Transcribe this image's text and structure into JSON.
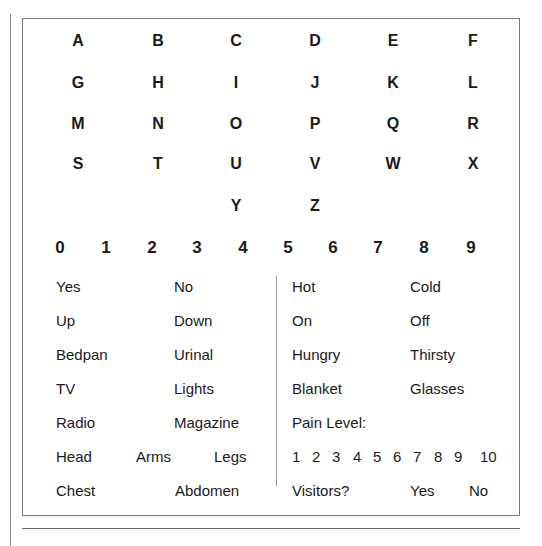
{
  "letters": [
    {
      "t": "A",
      "x": 78,
      "y": 41
    },
    {
      "t": "B",
      "x": 158,
      "y": 41
    },
    {
      "t": "C",
      "x": 236,
      "y": 41
    },
    {
      "t": "D",
      "x": 315,
      "y": 41
    },
    {
      "t": "E",
      "x": 393,
      "y": 41
    },
    {
      "t": "F",
      "x": 473,
      "y": 41
    },
    {
      "t": "G",
      "x": 78,
      "y": 83
    },
    {
      "t": "H",
      "x": 158,
      "y": 83
    },
    {
      "t": "I",
      "x": 236,
      "y": 83
    },
    {
      "t": "J",
      "x": 315,
      "y": 83
    },
    {
      "t": "K",
      "x": 393,
      "y": 83
    },
    {
      "t": "L",
      "x": 473,
      "y": 83
    },
    {
      "t": "M",
      "x": 78,
      "y": 124
    },
    {
      "t": "N",
      "x": 158,
      "y": 124
    },
    {
      "t": "O",
      "x": 236,
      "y": 124
    },
    {
      "t": "P",
      "x": 315,
      "y": 124
    },
    {
      "t": "Q",
      "x": 393,
      "y": 124
    },
    {
      "t": "R",
      "x": 473,
      "y": 124
    },
    {
      "t": "S",
      "x": 78,
      "y": 164
    },
    {
      "t": "T",
      "x": 158,
      "y": 164
    },
    {
      "t": "U",
      "x": 236,
      "y": 164
    },
    {
      "t": "V",
      "x": 315,
      "y": 164
    },
    {
      "t": "W",
      "x": 393,
      "y": 164
    },
    {
      "t": "X",
      "x": 473,
      "y": 164
    },
    {
      "t": "Y",
      "x": 236,
      "y": 206
    },
    {
      "t": "Z",
      "x": 315,
      "y": 206
    }
  ],
  "digits": [
    {
      "t": "0",
      "x": 60
    },
    {
      "t": "1",
      "x": 106
    },
    {
      "t": "2",
      "x": 152
    },
    {
      "t": "3",
      "x": 197
    },
    {
      "t": "4",
      "x": 243
    },
    {
      "t": "5",
      "x": 288
    },
    {
      "t": "6",
      "x": 333
    },
    {
      "t": "7",
      "x": 378
    },
    {
      "t": "8",
      "x": 424
    },
    {
      "t": "9",
      "x": 471
    }
  ],
  "digits_y": 247,
  "words_left": [
    {
      "t": "Yes",
      "x": 56,
      "y": 287
    },
    {
      "t": "No",
      "x": 174,
      "y": 287
    },
    {
      "t": "Up",
      "x": 56,
      "y": 321
    },
    {
      "t": "Down",
      "x": 174,
      "y": 321
    },
    {
      "t": "Bedpan",
      "x": 56,
      "y": 355
    },
    {
      "t": "Urinal",
      "x": 174,
      "y": 355
    },
    {
      "t": "TV",
      "x": 56,
      "y": 389
    },
    {
      "t": "Lights",
      "x": 174,
      "y": 389
    },
    {
      "t": "Radio",
      "x": 56,
      "y": 423
    },
    {
      "t": "Magazine",
      "x": 174,
      "y": 423
    },
    {
      "t": "Head",
      "x": 56,
      "y": 457
    },
    {
      "t": "Arms",
      "x": 136,
      "y": 457
    },
    {
      "t": "Legs",
      "x": 214,
      "y": 457
    },
    {
      "t": "Chest",
      "x": 56,
      "y": 491
    },
    {
      "t": "Abdomen",
      "x": 175,
      "y": 491
    }
  ],
  "words_right": [
    {
      "t": "Hot",
      "x": 292,
      "y": 287
    },
    {
      "t": "Cold",
      "x": 410,
      "y": 287
    },
    {
      "t": "On",
      "x": 292,
      "y": 321
    },
    {
      "t": "Off",
      "x": 410,
      "y": 321
    },
    {
      "t": "Hungry",
      "x": 292,
      "y": 355
    },
    {
      "t": "Thirsty",
      "x": 410,
      "y": 355
    },
    {
      "t": "Blanket",
      "x": 292,
      "y": 389
    },
    {
      "t": "Glasses",
      "x": 410,
      "y": 389
    },
    {
      "t": "Pain Level:",
      "x": 292,
      "y": 423
    },
    {
      "t": "Visitors?",
      "x": 292,
      "y": 491
    },
    {
      "t": "Yes",
      "x": 410,
      "y": 491
    },
    {
      "t": "No",
      "x": 469,
      "y": 491
    }
  ],
  "pain_scale": [
    {
      "t": "1",
      "x": 292
    },
    {
      "t": "2",
      "x": 312
    },
    {
      "t": "3",
      "x": 332
    },
    {
      "t": "4",
      "x": 353
    },
    {
      "t": "5",
      "x": 373
    },
    {
      "t": "6",
      "x": 393
    },
    {
      "t": "7",
      "x": 413
    },
    {
      "t": "8",
      "x": 434
    },
    {
      "t": "9",
      "x": 454
    },
    {
      "t": "10",
      "x": 480
    }
  ],
  "pain_scale_y": 457
}
